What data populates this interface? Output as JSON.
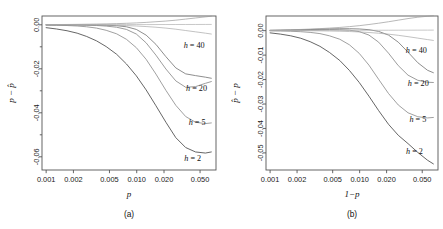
{
  "figure": {
    "panels": [
      {
        "id": "a",
        "caption": "(a)",
        "xlabel": "p",
        "ylabel_parts": [
          "p",
          "−",
          "p̂"
        ],
        "ylabel": "p − p̂"
      },
      {
        "id": "b",
        "caption": "(b)",
        "xlabel": "1−p",
        "ylabel_parts": [
          "p̂",
          "−",
          "p"
        ],
        "ylabel": "p̂ − p"
      }
    ]
  },
  "chart_data": [
    {
      "type": "line",
      "panel": "a",
      "title": "",
      "xlabel": "p",
      "ylabel": "p − p̂",
      "xscale": "log",
      "xlim": [
        0.0009,
        0.075
      ],
      "ylim": [
        -0.066,
        0.004
      ],
      "xticks": [
        0.001,
        0.002,
        0.005,
        0.01,
        0.02,
        0.05
      ],
      "xticklabels": [
        "0.001",
        "0.002",
        "0.005",
        "0.010",
        "0.020",
        "0.050"
      ],
      "yticks": [
        0.0,
        -0.02,
        -0.04,
        -0.06
      ],
      "yticklabels": [
        "0.00",
        "-0.02",
        "-0.04",
        "-0.06"
      ],
      "yminorticks": [
        -0.01,
        -0.03,
        -0.05
      ],
      "grid": false,
      "legend": "inline-labels",
      "x": [
        0.001,
        0.0013,
        0.0017,
        0.0022,
        0.0028,
        0.0036,
        0.0046,
        0.006,
        0.0077,
        0.0099,
        0.0127,
        0.0163,
        0.021,
        0.027,
        0.0347,
        0.0446,
        0.0573,
        0.0666
      ],
      "series": [
        {
          "name": "h = 2",
          "label": "h = 2",
          "color": "#4a4a4a",
          "label_xy": [
            0.0335,
            -0.0617
          ],
          "values": [
            -0.0013,
            -0.0019,
            -0.0027,
            -0.0038,
            -0.0053,
            -0.0073,
            -0.0099,
            -0.0134,
            -0.0178,
            -0.0232,
            -0.0296,
            -0.0368,
            -0.0443,
            -0.0513,
            -0.0558,
            -0.0578,
            -0.0583,
            -0.0578
          ]
        },
        {
          "name": "h = 5",
          "label": "h = 5",
          "color": "#8f8f8f",
          "label_xy": [
            0.0375,
            -0.0455
          ],
          "values": [
            -0.00012,
            -0.0002,
            -0.00033,
            -0.00055,
            -0.0009,
            -0.0015,
            -0.0025,
            -0.0041,
            -0.0066,
            -0.0104,
            -0.0157,
            -0.0224,
            -0.0298,
            -0.0366,
            -0.0417,
            -0.0443,
            -0.0449,
            -0.0446
          ]
        },
        {
          "name": "h = 20",
          "label": "h = 20",
          "color": "#8a8a8a",
          "label_xy": [
            0.035,
            -0.03
          ],
          "values": [
            -2e-05,
            -3e-05,
            -6e-05,
            -0.0001,
            -0.00018,
            -0.00032,
            -0.00058,
            -0.0011,
            -0.0021,
            -0.0042,
            -0.0082,
            -0.0138,
            -0.0201,
            -0.0255,
            -0.0284,
            -0.0281,
            -0.0266,
            -0.0258
          ]
        },
        {
          "name": "h = 40",
          "label": "h = 40",
          "color": "#7a7a7a",
          "label_xy": [
            0.033,
            -0.0105
          ],
          "values": [
            -5e-06,
            -1e-05,
            -2e-05,
            -3e-05,
            -6e-05,
            -0.00011,
            -0.0002,
            -0.0004,
            -0.0009,
            -0.0021,
            -0.0047,
            -0.0089,
            -0.0145,
            -0.0196,
            -0.0223,
            -0.0231,
            -0.0238,
            -0.0243
          ]
        },
        {
          "name": "near-zero-1",
          "label": "",
          "color": "#9a9a9a",
          "label_xy": null,
          "values": [
            0.0001,
            0.00012,
            0.00015,
            0.0002,
            0.00026,
            0.00033,
            0.00042,
            0.00054,
            0.00068,
            0.00086,
            0.0011,
            0.0014,
            0.0017,
            0.0021,
            0.0026,
            0.0031,
            0.0036,
            0.0039
          ]
        },
        {
          "name": "near-zero-2",
          "label": "",
          "color": "#b0b0b0",
          "label_xy": null,
          "values": [
            5e-05,
            5e-05,
            6e-05,
            6e-05,
            7e-05,
            7e-05,
            8e-05,
            8e-05,
            9e-05,
            0.0001,
            0.0001,
            0.00011,
            0.00012,
            0.00013,
            0.00014,
            0.00015,
            0.00016,
            0.00017
          ]
        },
        {
          "name": "near-zero-3",
          "label": "",
          "color": "#a8a8a8",
          "label_xy": null,
          "values": [
            2e-05,
            1e-05,
            0.0,
            -2e-05,
            -5e-05,
            -9e-05,
            -0.00015,
            -0.00024,
            -0.00037,
            -0.00055,
            -0.0008,
            -0.0011,
            -0.0015,
            -0.002,
            -0.0026,
            -0.0032,
            -0.0038,
            -0.0042
          ]
        }
      ]
    },
    {
      "type": "line",
      "panel": "b",
      "title": "",
      "xlabel": "1−p",
      "ylabel": "p̂ − p",
      "xscale": "log",
      "xlim": [
        0.0009,
        0.075
      ],
      "ylim": [
        -0.057,
        0.006
      ],
      "xticks": [
        0.001,
        0.002,
        0.005,
        0.01,
        0.02,
        0.05
      ],
      "xticklabels": [
        "0.001",
        "0.002",
        "0.005",
        "0.010",
        "0.020",
        "0.050"
      ],
      "yticks": [
        0.0,
        -0.01,
        -0.02,
        -0.03,
        -0.04,
        -0.05
      ],
      "yticklabels": [
        "0.00",
        "-0.01",
        "-0.02",
        "-0.03",
        "-0.04",
        "-0.05"
      ],
      "yminorticks": [],
      "grid": false,
      "legend": "inline-labels",
      "x": [
        0.001,
        0.0013,
        0.0017,
        0.0022,
        0.0028,
        0.0036,
        0.0046,
        0.006,
        0.0077,
        0.0099,
        0.0127,
        0.0163,
        0.021,
        0.027,
        0.0347,
        0.0446,
        0.0573,
        0.0666
      ],
      "series": [
        {
          "name": "h = 2",
          "label": "h = 2",
          "color": "#4a4a4a",
          "label_xy": [
            0.033,
            -0.0505
          ],
          "values": [
            -0.0009,
            -0.0014,
            -0.0021,
            -0.0031,
            -0.0045,
            -0.0064,
            -0.0089,
            -0.0122,
            -0.0163,
            -0.0212,
            -0.0268,
            -0.0327,
            -0.0383,
            -0.0428,
            -0.0462,
            -0.0498,
            -0.053,
            -0.0545
          ]
        },
        {
          "name": "h = 5",
          "label": "h = 5",
          "color": "#8f8f8f",
          "label_xy": [
            0.036,
            -0.0375
          ],
          "values": [
            -8e-05,
            -0.00014,
            -0.00024,
            -0.00042,
            -0.0007,
            -0.0012,
            -0.0021,
            -0.0035,
            -0.0058,
            -0.0093,
            -0.0141,
            -0.0199,
            -0.0257,
            -0.0304,
            -0.0336,
            -0.0352,
            -0.0357,
            -0.0355
          ]
        },
        {
          "name": "h = 20",
          "label": "h = 20",
          "color": "#8a8a8a",
          "label_xy": [
            0.0345,
            -0.0228
          ],
          "values": [
            8e-05,
            0.00012,
            0.00018,
            0.00025,
            0.00032,
            0.0004,
            0.00045,
            0.0004,
            0.0002,
            -0.0004,
            -0.0018,
            -0.0047,
            -0.0092,
            -0.0143,
            -0.0182,
            -0.0203,
            -0.0211,
            -0.0212
          ]
        },
        {
          "name": "h = 40",
          "label": "h = 40",
          "color": "#7a7a7a",
          "label_xy": [
            0.0328,
            -0.0092
          ],
          "values": [
            0.00012,
            0.00018,
            0.00026,
            0.00036,
            0.00048,
            0.0006,
            0.00072,
            0.0008,
            0.0008,
            0.0007,
            0.0004,
            -0.0003,
            -0.0018,
            -0.0047,
            -0.0088,
            -0.0131,
            -0.0162,
            -0.0172
          ]
        },
        {
          "name": "near-zero-1",
          "label": "",
          "color": "#9a9a9a",
          "label_xy": null,
          "values": [
            0.0002,
            0.00028,
            0.00038,
            0.0005,
            0.00065,
            0.00083,
            0.00105,
            0.00132,
            0.00165,
            0.00205,
            0.00252,
            0.00305,
            0.00365,
            0.0043,
            0.00495,
            0.0055,
            0.0059,
            0.0061
          ]
        },
        {
          "name": "near-zero-2",
          "label": "",
          "color": "#b0b0b0",
          "label_xy": null,
          "values": [
            6e-05,
            7e-05,
            8e-05,
            9e-05,
            0.0001,
            0.00011,
            0.00012,
            0.00013,
            0.00014,
            0.00015,
            0.00016,
            0.00017,
            0.00018,
            0.00019,
            0.0002,
            0.00021,
            0.00022,
            0.00023
          ]
        },
        {
          "name": "near-zero-3",
          "label": "",
          "color": "#a8a8a8",
          "label_xy": null,
          "values": [
            3e-05,
            2e-05,
            1e-05,
            -1e-05,
            -4e-05,
            -8e-05,
            -0.00014,
            -0.00023,
            -0.00035,
            -0.00052,
            -0.00075,
            -0.00105,
            -0.00143,
            -0.0019,
            -0.00245,
            -0.00305,
            -0.00365,
            -0.004
          ]
        }
      ]
    }
  ]
}
